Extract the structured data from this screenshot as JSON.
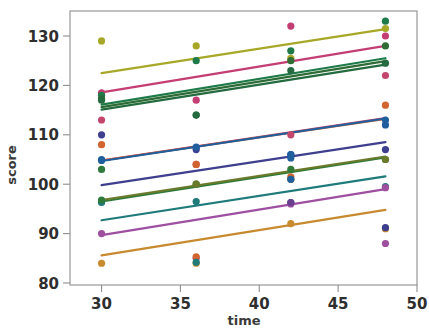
{
  "chart_data": {
    "type": "scatter",
    "title": "",
    "subtitle": "",
    "xlabel": "time",
    "ylabel": "score",
    "xlim": [
      28,
      50
    ],
    "ylim": [
      80,
      133
    ],
    "xticks": [
      30,
      35,
      40,
      45,
      50
    ],
    "yticks": [
      80,
      90,
      100,
      110,
      120,
      130
    ],
    "xtick_labels": [
      "30",
      "35",
      "40",
      "45",
      "50"
    ],
    "ytick_labels": [
      "80",
      "90",
      "100",
      "110",
      "120",
      "130"
    ],
    "grid": false,
    "legend": "none",
    "x": [
      30,
      36,
      42,
      48
    ],
    "series": [
      {
        "name": "subject-1",
        "color": "#a8a828",
        "points": [
          129.0,
          128.0,
          125.5,
          131.5
        ],
        "fit_start": 122.5,
        "fit_end": 131.4
      },
      {
        "name": "subject-2",
        "color": "#c43d73",
        "points": [
          118.5,
          117.0,
          132.0,
          130.0
        ],
        "fit_start": 118.6,
        "fit_end": 128.0
      },
      {
        "name": "subject-3",
        "color": "#1f7a4a",
        "points": [
          118.0,
          125.0,
          127.0,
          133.0
        ],
        "fit_start": 116.1,
        "fit_end": 125.5
      },
      {
        "name": "subject-4",
        "color": "#2e6b35",
        "points": [
          117.3,
          114.0,
          125.0,
          128.0
        ],
        "fit_start": 115.6,
        "fit_end": 124.9
      },
      {
        "name": "subject-5",
        "color": "#246b3f",
        "points": [
          117.0,
          114.0,
          123.0,
          124.5
        ],
        "fit_start": 115.1,
        "fit_end": 124.2
      },
      {
        "name": "subject-6",
        "color": "#c4476b",
        "points": [
          113.0,
          104.0,
          110.0,
          122.0
        ],
        "fit_start": 104.8,
        "fit_end": 113.4
      },
      {
        "name": "subject-7",
        "color": "#3f3f8f",
        "points": [
          110.0,
          107.0,
          106.0,
          107.0
        ],
        "fit_start": 99.8,
        "fit_end": 108.5
      },
      {
        "name": "subject-8",
        "color": "#d2642f",
        "points": [
          108.0,
          104.0,
          101.5,
          116.0
        ],
        "fit_start": 104.8,
        "fit_end": 113.2
      },
      {
        "name": "subject-9",
        "color": "#1f5f9e",
        "points": [
          105.0,
          107.5,
          106.0,
          113.0
        ],
        "fit_start": 104.7,
        "fit_end": 113.3
      },
      {
        "name": "subject-10",
        "color": "#2f7a3a",
        "points": [
          103.0,
          100.0,
          103.0,
          105.0
        ],
        "fit_start": 96.5,
        "fit_end": 105.4
      },
      {
        "name": "subject-11",
        "color": "#6b7a2a",
        "points": [
          96.5,
          100.0,
          101.0,
          105.0
        ],
        "fit_start": 96.8,
        "fit_end": 105.6
      },
      {
        "name": "subject-12",
        "color": "#1f7a7a",
        "points": [
          96.3,
          96.5,
          96.3,
          99.5
        ],
        "fit_start": 92.7,
        "fit_end": 101.6
      },
      {
        "name": "subject-13",
        "color": "#9e4fa0",
        "points": [
          90.0,
          85.0,
          96.0,
          99.3
        ],
        "fit_start": 89.7,
        "fit_end": 99.0
      },
      {
        "name": "subject-14",
        "color": "#c88a2f",
        "points": [
          84.0,
          84.0,
          92.0,
          91.0
        ],
        "fit_start": 85.6,
        "fit_end": 94.8
      }
    ],
    "extra_points": [
      {
        "x": 36,
        "y": 85.3,
        "color": "#d2642f"
      },
      {
        "x": 36,
        "y": 84.2,
        "color": "#1f7a7a"
      },
      {
        "x": 42,
        "y": 101.0,
        "color": "#1f5f9e"
      },
      {
        "x": 48,
        "y": 112.0,
        "color": "#1f5f9e"
      },
      {
        "x": 48,
        "y": 91.2,
        "color": "#3f3f8f"
      },
      {
        "x": 48,
        "y": 88.0,
        "color": "#9e4fa0"
      },
      {
        "x": 30,
        "y": 104.8,
        "color": "#1f5f9e"
      },
      {
        "x": 42,
        "y": 105.3,
        "color": "#1f5f9e"
      },
      {
        "x": 42,
        "y": 96.3,
        "color": "#6b3f8f"
      },
      {
        "x": 30,
        "y": 96.8,
        "color": "#2f7a3a"
      }
    ]
  },
  "axes": {
    "x_title": "time",
    "y_title": "score"
  }
}
